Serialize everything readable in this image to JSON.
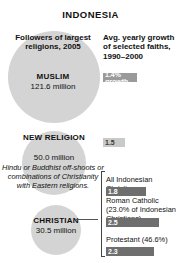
{
  "title": "INDONESIA",
  "left_column": {
    "caption": "Followers of largest religions, 2005",
    "bubbles": [
      {
        "name": "MUSLIM",
        "value": "121.6 million",
        "description": ""
      },
      {
        "name": "NEW RELIGION",
        "value": "50.0 million",
        "description": "Hindu or Buddhist off-shoots or combinations of Christianity with Eastern religions."
      },
      {
        "name": "CHRISTIAN",
        "value": "30.5 million",
        "description": ""
      }
    ]
  },
  "right_column": {
    "caption": "Avg. yearly growth of selected faiths, 1990–2000",
    "bars": [
      {
        "label": "",
        "value": "1.4% growth"
      },
      {
        "label": "",
        "value": "1.5"
      },
      {
        "label": "All Indonesian Christians",
        "value": "1.8"
      },
      {
        "label": "Roman Catholic (23.0% of Indonesian Christians)",
        "value": "2.5"
      },
      {
        "label": "Protestant (46.6%)",
        "value": "2.3"
      }
    ]
  },
  "chart_data": {
    "type": "bar",
    "title": "INDONESIA",
    "subtitle": "Avg. yearly growth of selected faiths, 1990–2000",
    "xlabel": "Average yearly growth (%)",
    "ylabel": "",
    "categories": [
      "Muslim",
      "New Religion",
      "All Indonesian Christians",
      "Roman Catholic (23.0% of Indonesian Christians)",
      "Protestant (46.6%)"
    ],
    "values": [
      1.4,
      1.5,
      1.8,
      2.5,
      2.3
    ],
    "value_labels": [
      "1.4% growth",
      "1.5",
      "1.8",
      "2.5",
      "2.3"
    ],
    "xlim": [
      0,
      3
    ],
    "grid": false,
    "legend": "none",
    "bubbles": {
      "type": "bubble",
      "title": "Followers of largest religions, 2005",
      "categories": [
        "MUSLIM",
        "NEW RELIGION",
        "CHRISTIAN"
      ],
      "values": [
        121.6,
        50.0,
        30.5
      ],
      "unit": "million",
      "value_labels": [
        "121.6 million",
        "50.0 million",
        "30.5 million"
      ]
    }
  },
  "colors": {
    "bubble_fill": "#d4d4d4",
    "bar_dark": "#6e6e6e",
    "bar_mid": "#9a9a9a",
    "bar_light": "#c9c9c9",
    "text": "#111111",
    "background": "#ffffff"
  }
}
